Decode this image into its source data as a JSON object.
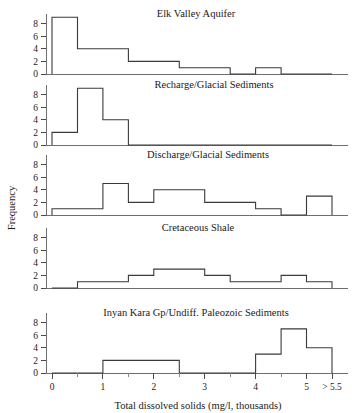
{
  "figure": {
    "xlabel": "Total dissolved solids (mg/l, thousands)",
    "ylabel": "Frequency",
    "y_ticks": [
      "0",
      "2",
      "4",
      "6",
      "8"
    ],
    "x_ticks": [
      "0",
      "1",
      "2",
      "3",
      "4",
      "5",
      "> 5.5"
    ],
    "line_color": "#3a3a3a",
    "axis_color": "#6e6e6e",
    "background": "#ffffff"
  },
  "chart_data": [
    {
      "type": "bar",
      "title": "Elk Valley Aquifer",
      "xlabel": "Total dissolved solids (mg/l, thousands)",
      "ylabel": "Frequency",
      "xlim": [
        0,
        5.5
      ],
      "ylim": [
        0,
        9.5
      ],
      "grid": false,
      "bin_edges": [
        0,
        0.5,
        1.0,
        1.5,
        2.0,
        2.5,
        3.0,
        3.5,
        4.0,
        4.5,
        5.0,
        5.5
      ],
      "values": [
        9,
        4,
        4,
        2,
        2,
        1,
        1,
        0,
        1,
        0,
        0,
        0
      ],
      "bin_labels": [
        "0-0.5",
        "0.5-1.0",
        "1.0-1.5",
        "1.5-2.0",
        "2.0-2.5",
        "2.5-3.0",
        "3.0-3.5",
        "3.5-4.0",
        "4.0-4.5",
        "4.5-5.0",
        "5.0-5.5"
      ]
    },
    {
      "type": "bar",
      "title": "Recharge/Glacial Sediments",
      "xlabel": "Total dissolved solids (mg/l, thousands)",
      "ylabel": "Frequency",
      "xlim": [
        0,
        5.5
      ],
      "ylim": [
        0,
        9.5
      ],
      "grid": false,
      "bin_edges": [
        0,
        0.5,
        1.0,
        1.5,
        2.0,
        2.5,
        3.0,
        3.5,
        4.0,
        4.5,
        5.0,
        5.5
      ],
      "values": [
        2,
        9,
        4,
        0,
        0,
        0,
        0,
        0,
        0,
        0,
        0
      ],
      "bin_labels": [
        "0-0.5",
        "0.5-1.0",
        "1.0-1.5",
        "1.5-2.0",
        "2.0-2.5",
        "2.5-3.0",
        "3.0-3.5",
        "3.5-4.0",
        "4.0-4.5",
        "4.5-5.0",
        "5.0-5.5"
      ]
    },
    {
      "type": "bar",
      "title": "Discharge/Glacial Sediments",
      "xlabel": "Total dissolved solids (mg/l, thousands)",
      "ylabel": "Frequency",
      "xlim": [
        0,
        5.5
      ],
      "ylim": [
        0,
        9.5
      ],
      "grid": false,
      "bin_edges": [
        0,
        0.5,
        1.0,
        1.5,
        2.0,
        2.5,
        3.0,
        3.5,
        4.0,
        4.5,
        5.0,
        5.5
      ],
      "values": [
        1,
        1,
        5,
        2,
        4,
        4,
        2,
        2,
        1,
        0,
        3,
        5
      ],
      "bin_labels": [
        "0-0.5",
        "0.5-1.0",
        "1.0-1.5",
        "1.5-2.0",
        "2.0-2.5",
        "2.5-3.0",
        "3.0-3.5",
        "3.5-4.0",
        "4.0-4.5",
        "4.5-5.0",
        "5.0-5.5"
      ]
    },
    {
      "type": "bar",
      "title": "Cretaceous Shale",
      "xlabel": "Total dissolved solids (mg/l, thousands)",
      "ylabel": "Frequency",
      "xlim": [
        0,
        5.5
      ],
      "ylim": [
        0,
        9.5
      ],
      "grid": false,
      "bin_edges": [
        0,
        0.5,
        1.0,
        1.5,
        2.0,
        2.5,
        3.0,
        3.5,
        4.0,
        4.5,
        5.0,
        5.5
      ],
      "values": [
        0,
        1,
        1,
        2,
        3,
        3,
        2,
        1,
        1,
        2,
        1,
        1
      ],
      "bin_labels": [
        "0-0.5",
        "0.5-1.0",
        "1.0-1.5",
        "1.5-2.0",
        "2.0-2.5",
        "2.5-3.0",
        "3.0-3.5",
        "3.5-4.0",
        "4.0-4.5",
        "4.5-5.0",
        "5.0-5.5"
      ]
    },
    {
      "type": "bar",
      "title": "Inyan Kara Gp/Undiff. Paleozoic Sediments",
      "xlabel": "Total dissolved solids (mg/l, thousands)",
      "ylabel": "Frequency",
      "xlim": [
        0,
        5.5
      ],
      "ylim": [
        0,
        9.5
      ],
      "grid": false,
      "bin_edges": [
        0,
        0.5,
        1.0,
        1.5,
        2.0,
        2.5,
        3.0,
        3.5,
        4.0,
        4.5,
        5.0,
        5.5
      ],
      "values": [
        0,
        0,
        2,
        2,
        2,
        0,
        0,
        0,
        3,
        7,
        4,
        3
      ],
      "bin_labels": [
        "0-0.5",
        "0.5-1.0",
        "1.0-1.5",
        "1.5-2.0",
        "2.0-2.5",
        "2.5-3.0",
        "3.0-3.5",
        "3.5-4.0",
        "4.0-4.5",
        "4.5-5.0",
        "5.0-5.5"
      ]
    }
  ]
}
